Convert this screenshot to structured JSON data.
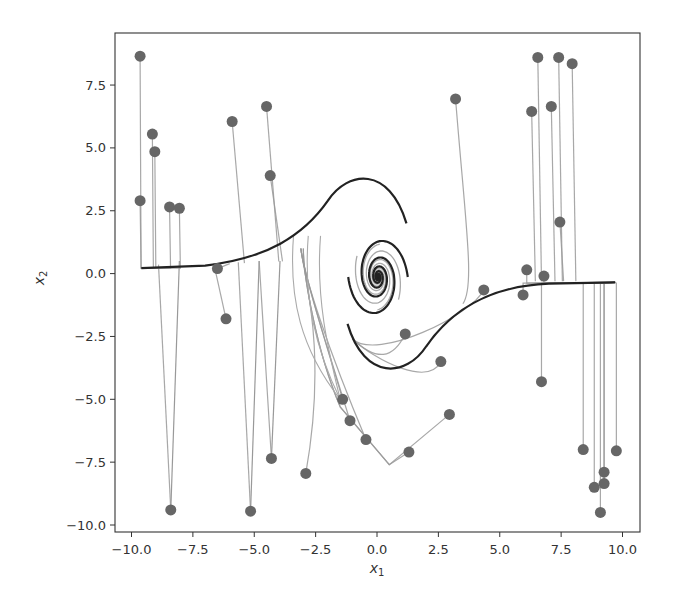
{
  "chart_data": {
    "type": "line",
    "title": "",
    "xlabel": "x₁",
    "ylabel": "x₂",
    "xlim": [
      -10.6,
      10.6
    ],
    "ylim": [
      -10.3,
      9.6
    ],
    "xticks": [
      -10.0,
      -7.5,
      -5.0,
      -2.5,
      0.0,
      2.5,
      5.0,
      7.5,
      10.0
    ],
    "xtick_labels": [
      "−10.0",
      "−7.5",
      "−5.0",
      "−2.5",
      "0.0",
      "2.5",
      "5.0",
      "7.5",
      "10.0"
    ],
    "yticks": [
      -10.0,
      -7.5,
      -5.0,
      -2.5,
      0.0,
      2.5,
      5.0,
      7.5
    ],
    "ytick_labels": [
      "−10.0",
      "−7.5",
      "−5.0",
      "−2.5",
      "0.0",
      "2.5",
      "5.0",
      "7.5"
    ],
    "grid": false,
    "legend": null,
    "initial_points": [
      [
        -9.65,
        8.65
      ],
      [
        -9.65,
        2.9
      ],
      [
        -9.15,
        5.55
      ],
      [
        -9.05,
        4.85
      ],
      [
        -8.45,
        2.65
      ],
      [
        -8.05,
        2.6
      ],
      [
        -6.5,
        0.2
      ],
      [
        -6.15,
        -1.8
      ],
      [
        -8.4,
        -9.4
      ],
      [
        -5.15,
        -9.45
      ],
      [
        -5.9,
        6.05
      ],
      [
        -4.5,
        6.65
      ],
      [
        -4.35,
        3.9
      ],
      [
        -4.3,
        -7.35
      ],
      [
        -2.9,
        -7.95
      ],
      [
        -1.4,
        -5.0
      ],
      [
        -1.1,
        -5.85
      ],
      [
        -0.45,
        -6.6
      ],
      [
        1.3,
        -7.1
      ],
      [
        1.15,
        -2.4
      ],
      [
        2.6,
        -3.5
      ],
      [
        2.95,
        -5.6
      ],
      [
        3.2,
        6.95
      ],
      [
        4.35,
        -0.65
      ],
      [
        6.3,
        6.45
      ],
      [
        6.55,
        8.6
      ],
      [
        7.4,
        8.6
      ],
      [
        7.95,
        8.35
      ],
      [
        7.1,
        6.65
      ],
      [
        7.45,
        2.05
      ],
      [
        6.1,
        0.15
      ],
      [
        6.8,
        -0.1
      ],
      [
        5.95,
        -0.85
      ],
      [
        6.7,
        -4.3
      ],
      [
        8.4,
        -7.0
      ],
      [
        9.75,
        -7.05
      ],
      [
        9.25,
        -7.9
      ],
      [
        9.25,
        -8.35
      ],
      [
        8.85,
        -8.5
      ],
      [
        9.1,
        -9.5
      ]
    ],
    "equilibrium": [
      0.0,
      -0.1
    ],
    "separatrix_left_asymptote_x2": 0.25,
    "separatrix_right_asymptote_x2": -0.35,
    "colors": {
      "trajectory": "#999999",
      "main_curve": "#222222",
      "points": "#666666",
      "axes": "#333333"
    }
  }
}
